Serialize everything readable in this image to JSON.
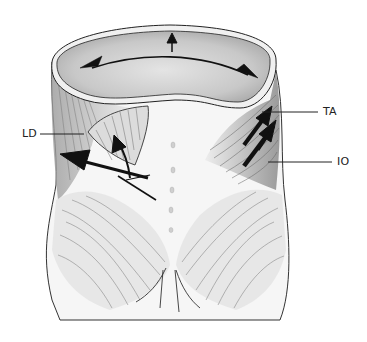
{
  "figure": {
    "labels": [
      {
        "id": "LD",
        "text": "LD",
        "meaning_hint": "latissimus dorsi"
      },
      {
        "id": "TA",
        "text": "TA",
        "meaning_hint": "transversus abdominis"
      },
      {
        "id": "IO",
        "text": "IO",
        "meaning_hint": "internal oblique"
      }
    ],
    "arrows": [
      {
        "name": "top-bidirectional-arrow",
        "direction": "left-right"
      },
      {
        "name": "top-up-arrow",
        "direction": "up"
      },
      {
        "name": "ld-up-arrow",
        "direction": "up"
      },
      {
        "name": "ld-left-arrow",
        "direction": "left"
      },
      {
        "name": "ta-arrow",
        "direction": "up-right"
      },
      {
        "name": "io-arrow",
        "direction": "up-right"
      }
    ],
    "colors": {
      "ink": "#1a1a1a",
      "shade": "#bdbdbd",
      "background": "#ffffff"
    }
  }
}
